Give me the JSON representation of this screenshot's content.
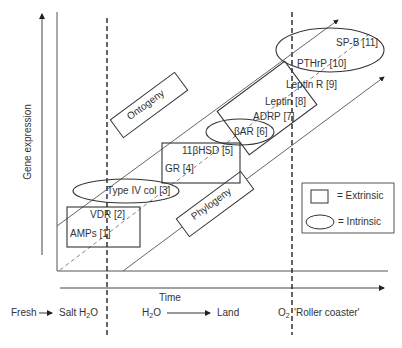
{
  "axes": {
    "y_label": "Gene expression",
    "x_label": "Time"
  },
  "bands": {
    "ontogeny": "Ontogeny",
    "phylogeny": "Phylogeny"
  },
  "genes": [
    {
      "label": "AMPs [1]",
      "group": "extrinsic"
    },
    {
      "label": "VDR [2]",
      "group": "extrinsic"
    },
    {
      "label": "Type IV col [3]",
      "group": "intrinsic"
    },
    {
      "label": "GR [4]",
      "group": "extrinsic"
    },
    {
      "label": "11βHSD [5]",
      "group": "extrinsic"
    },
    {
      "label": "βAR [6]",
      "group": "intrinsic"
    },
    {
      "label": "ADRP [7]",
      "group": "extrinsic"
    },
    {
      "label": "Leptin [8]",
      "group": "extrinsic"
    },
    {
      "label": "Leptin R [9]",
      "group": "extrinsic"
    },
    {
      "label": "PTHrP [10]",
      "group": "intrinsic"
    },
    {
      "label": "SP-B [11]",
      "group": "intrinsic"
    }
  ],
  "legend": {
    "extrinsic": "= Extrinsic",
    "intrinsic": "= Intrinsic"
  },
  "transitions": {
    "fresh": "Fresh",
    "salt_h": "Salt H",
    "salt_sub": "2",
    "salt_o": "O",
    "water_h": "H",
    "water_sub": "2",
    "water_o": "O",
    "land": "Land",
    "o2_o": "O",
    "o2_sub": "2",
    "roller": "'Roller coaster'"
  },
  "colors": {
    "line": "#333333",
    "dashed": "#222222",
    "text": "#333333"
  }
}
